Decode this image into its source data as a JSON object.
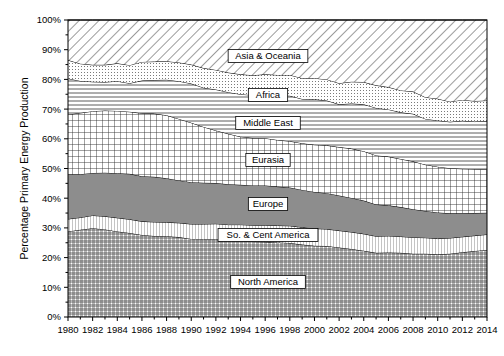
{
  "chart_data": {
    "type": "area",
    "title": "",
    "xlabel": "",
    "ylabel": "Percentage Primary Energy Production",
    "stacked": true,
    "stack_order": "bottom-to-top",
    "grid": false,
    "legend_position": "inline-labels",
    "xlim": [
      1980,
      2014
    ],
    "ylim": [
      0,
      100
    ],
    "ytick_labels": [
      "0%",
      "10%",
      "20%",
      "30%",
      "40%",
      "50%",
      "60%",
      "70%",
      "80%",
      "90%",
      "100%"
    ],
    "ytick_values": [
      0,
      10,
      20,
      30,
      40,
      50,
      60,
      70,
      80,
      90,
      100
    ],
    "xtick_labels": [
      "1980",
      "1982",
      "1984",
      "1986",
      "1988",
      "1990",
      "1992",
      "1994",
      "1996",
      "1998",
      "2000",
      "2002",
      "2004",
      "2006",
      "2008",
      "2010",
      "2012",
      "2014"
    ],
    "xtick_values": [
      1980,
      1982,
      1984,
      1986,
      1988,
      1990,
      1992,
      1994,
      1996,
      1998,
      2000,
      2002,
      2004,
      2006,
      2008,
      2010,
      2012,
      2014
    ],
    "x": [
      1980,
      1981,
      1982,
      1983,
      1984,
      1985,
      1986,
      1987,
      1988,
      1989,
      1990,
      1991,
      1992,
      1993,
      1994,
      1995,
      1996,
      1997,
      1998,
      1999,
      2000,
      2001,
      2002,
      2003,
      2004,
      2005,
      2006,
      2007,
      2008,
      2009,
      2010,
      2011,
      2012,
      2013,
      2014
    ],
    "series": [
      {
        "name": "North America",
        "pattern": "fine-crosshatch",
        "values": [
          28.8,
          29.4,
          29.9,
          29.5,
          28.8,
          28.3,
          27.6,
          27.3,
          27.2,
          26.9,
          26.3,
          26.2,
          26.2,
          25.8,
          25.7,
          25.4,
          25.3,
          25.1,
          24.9,
          24.4,
          24.0,
          23.9,
          23.4,
          22.9,
          22.3,
          21.6,
          21.7,
          21.6,
          21.3,
          21.3,
          21.1,
          21.3,
          21.8,
          22.2,
          22.6
        ]
      },
      {
        "name": "So. & Cent America",
        "pattern": "fine-vertical-lines",
        "values": [
          4.2,
          4.1,
          4.3,
          4.4,
          4.6,
          4.6,
          4.6,
          4.7,
          4.7,
          4.8,
          5.0,
          5.1,
          5.2,
          5.3,
          5.4,
          5.5,
          5.6,
          5.7,
          5.8,
          5.8,
          5.8,
          5.7,
          5.7,
          5.7,
          5.7,
          5.6,
          5.6,
          5.5,
          5.5,
          5.4,
          5.3,
          5.3,
          5.2,
          5.2,
          5.2
        ]
      },
      {
        "name": "Europe",
        "pattern": "solid-gray",
        "values": [
          15.0,
          14.6,
          14.3,
          14.7,
          15.0,
          15.3,
          15.2,
          15.2,
          14.8,
          14.3,
          14.1,
          13.9,
          13.7,
          13.6,
          13.4,
          13.4,
          13.4,
          13.1,
          12.9,
          12.6,
          12.3,
          12.1,
          11.8,
          11.5,
          11.2,
          10.7,
          10.3,
          9.9,
          9.5,
          9.0,
          8.8,
          8.3,
          7.9,
          7.6,
          7.3
        ]
      },
      {
        "name": "Eurasia",
        "pattern": "crosshatch-grid",
        "values": [
          20.2,
          20.6,
          20.8,
          20.9,
          21.0,
          20.9,
          21.2,
          21.3,
          21.2,
          20.7,
          20.0,
          18.8,
          17.7,
          17.0,
          16.2,
          16.0,
          15.9,
          15.7,
          15.6,
          15.7,
          15.9,
          16.1,
          16.3,
          16.6,
          16.6,
          16.5,
          16.4,
          16.2,
          16.1,
          15.6,
          15.4,
          15.2,
          15.0,
          14.8,
          14.6
        ]
      },
      {
        "name": "Middle East",
        "pattern": "horizontal-lines",
        "values": [
          12.1,
          10.8,
          9.9,
          9.6,
          10.0,
          9.6,
          11.0,
          11.3,
          12.0,
          12.7,
          13.2,
          13.2,
          13.8,
          14.0,
          14.3,
          14.4,
          14.6,
          14.9,
          15.3,
          14.9,
          15.3,
          15.1,
          14.4,
          15.2,
          15.8,
          16.0,
          15.9,
          15.7,
          16.0,
          15.4,
          15.6,
          15.6,
          16.2,
          16.0,
          16.3
        ]
      },
      {
        "name": "Africa",
        "pattern": "fine-dots",
        "values": [
          6.2,
          5.8,
          5.7,
          5.8,
          6.0,
          6.1,
          6.3,
          6.2,
          6.2,
          6.3,
          6.4,
          6.6,
          6.6,
          6.6,
          6.7,
          6.7,
          6.9,
          7.0,
          7.0,
          7.0,
          7.1,
          7.1,
          7.1,
          7.3,
          7.5,
          7.6,
          7.5,
          7.4,
          7.5,
          7.3,
          7.3,
          6.8,
          7.0,
          6.9,
          6.9
        ]
      },
      {
        "name": "Asia & Oceania",
        "pattern": "diagonal-hatch",
        "values": [
          13.5,
          14.7,
          15.1,
          15.1,
          14.6,
          15.2,
          14.1,
          14.0,
          13.9,
          14.3,
          15.0,
          16.2,
          16.8,
          17.7,
          18.3,
          18.6,
          18.3,
          18.5,
          18.5,
          19.6,
          19.6,
          20.0,
          21.3,
          20.8,
          20.9,
          22.0,
          22.6,
          23.7,
          24.1,
          26.0,
          26.5,
          27.5,
          26.9,
          27.3,
          27.1
        ]
      }
    ]
  },
  "plot": {
    "left": 68,
    "top": 20,
    "right": 487,
    "bottom": 317
  },
  "series_label_positions": [
    {
      "name": "Asia & Oceania",
      "x": 268,
      "y": 56
    },
    {
      "name": "Africa",
      "x": 268,
      "y": 95
    },
    {
      "name": "Middle East",
      "x": 268,
      "y": 123
    },
    {
      "name": "Eurasia",
      "x": 268,
      "y": 160
    },
    {
      "name": "Europe",
      "x": 268,
      "y": 204
    },
    {
      "name": "So. & Cent America",
      "x": 268,
      "y": 235
    },
    {
      "name": "North America",
      "x": 268,
      "y": 282
    }
  ]
}
